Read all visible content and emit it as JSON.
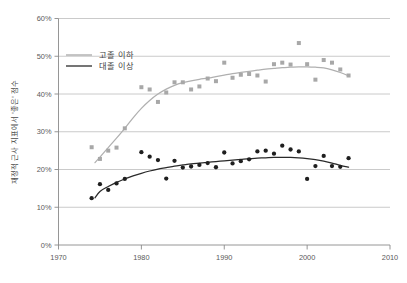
{
  "chart_data": {
    "type": "scatter",
    "title": "",
    "subtitle": "",
    "xlabel": "",
    "ylabel": "재정적 근사 지표에서 '좋은' 점수",
    "xlim": [
      1970,
      2010
    ],
    "ylim": [
      0,
      60
    ],
    "xticks": [
      1970,
      1980,
      1990,
      2000,
      2010
    ],
    "yticks": [
      0,
      10,
      20,
      30,
      40,
      50,
      60
    ],
    "xtick_labels": [
      "1970",
      "1980",
      "1990",
      "2000",
      "2010"
    ],
    "ytick_labels": [
      "0%",
      "10%",
      "20%",
      "30%",
      "40%",
      "50%",
      "60%"
    ],
    "grid": "horizontal",
    "legend_position": "upper-left-inside",
    "series": [
      {
        "name": "고졸 이하",
        "color": "#a8a8a8",
        "marker": "square",
        "x": [
          1974,
          1975,
          1976,
          1977,
          1978,
          1980,
          1981,
          1982,
          1983,
          1984,
          1985,
          1986,
          1987,
          1988,
          1989,
          1990,
          1991,
          1992,
          1993,
          1994,
          1995,
          1996,
          1997,
          1998,
          1999,
          2000,
          2001,
          2002,
          2003,
          2004,
          2005
        ],
        "values": [
          25.9,
          22.8,
          25.0,
          25.8,
          30.9,
          41.8,
          41.2,
          37.9,
          40.4,
          43.1,
          43.1,
          41.2,
          42.0,
          44.1,
          43.4,
          48.3,
          44.3,
          45.1,
          45.3,
          44.9,
          43.3,
          47.9,
          48.3,
          47.8,
          53.5,
          47.9,
          43.8,
          49.0,
          48.3,
          46.5,
          44.9
        ],
        "trend": {
          "name": "고졸 이하 추세선",
          "color": "#b0b0b0",
          "points": [
            [
              1974.4,
              21.8
            ],
            [
              1975,
              23.3
            ],
            [
              1976,
              25.8
            ],
            [
              1977,
              28.3
            ],
            [
              1978,
              30.9
            ],
            [
              1979,
              33.7
            ],
            [
              1980,
              36.2
            ],
            [
              1981,
              38.3
            ],
            [
              1982,
              40.0
            ],
            [
              1983,
              41.3
            ],
            [
              1984,
              42.3
            ],
            [
              1985,
              43.0
            ],
            [
              1986,
              43.5
            ],
            [
              1987,
              43.9
            ],
            [
              1988,
              44.2
            ],
            [
              1989,
              44.6
            ],
            [
              1990,
              45.0
            ],
            [
              1991,
              45.4
            ],
            [
              1992,
              45.7
            ],
            [
              1993,
              46.0
            ],
            [
              1994,
              46.3
            ],
            [
              1995,
              46.6
            ],
            [
              1996,
              46.8
            ],
            [
              1997,
              47.0
            ],
            [
              1998,
              47.1
            ],
            [
              1999,
              47.2
            ],
            [
              2000,
              47.2
            ],
            [
              2001,
              47.1
            ],
            [
              2002,
              46.9
            ],
            [
              2003,
              46.4
            ],
            [
              2004,
              45.7
            ],
            [
              2005,
              44.8
            ]
          ]
        }
      },
      {
        "name": "대졸 이상",
        "color": "#1f1f1f",
        "marker": "circle",
        "x": [
          1974,
          1975,
          1976,
          1977,
          1978,
          1980,
          1981,
          1982,
          1983,
          1984,
          1985,
          1986,
          1987,
          1988,
          1989,
          1990,
          1991,
          1992,
          1993,
          1994,
          1995,
          1996,
          1997,
          1998,
          1999,
          2000,
          2001,
          2002,
          2003,
          2004,
          2005
        ],
        "values": [
          12.4,
          16.1,
          14.6,
          16.3,
          17.5,
          24.6,
          23.4,
          22.5,
          17.6,
          22.3,
          20.5,
          20.8,
          21.2,
          21.7,
          20.6,
          24.5,
          21.6,
          22.2,
          22.7,
          24.8,
          25.0,
          24.2,
          26.3,
          25.3,
          24.8,
          17.5,
          20.9,
          23.6,
          20.9,
          20.7,
          23.0
        ],
        "trend": {
          "name": "대졸 이상 추세선",
          "color": "#2a2a2a",
          "points": [
            [
              1974.4,
              12.5
            ],
            [
              1975,
              14.2
            ],
            [
              1976,
              15.5
            ],
            [
              1977,
              16.6
            ],
            [
              1978,
              17.5
            ],
            [
              1979,
              18.3
            ],
            [
              1980,
              19.0
            ],
            [
              1981,
              19.6
            ],
            [
              1982,
              20.1
            ],
            [
              1983,
              20.5
            ],
            [
              1984,
              20.9
            ],
            [
              1985,
              21.2
            ],
            [
              1986,
              21.5
            ],
            [
              1987,
              21.7
            ],
            [
              1988,
              21.9
            ],
            [
              1989,
              22.1
            ],
            [
              1990,
              22.3
            ],
            [
              1991,
              22.5
            ],
            [
              1992,
              22.7
            ],
            [
              1993,
              22.9
            ],
            [
              1994,
              23.0
            ],
            [
              1995,
              23.1
            ],
            [
              1996,
              23.2
            ],
            [
              1997,
              23.2
            ],
            [
              1998,
              23.2
            ],
            [
              1999,
              23.1
            ],
            [
              2000,
              22.9
            ],
            [
              2001,
              22.6
            ],
            [
              2002,
              22.2
            ],
            [
              2003,
              21.7
            ],
            [
              2004,
              21.1
            ],
            [
              2005,
              20.6
            ]
          ]
        }
      }
    ]
  },
  "legend": {
    "items": [
      {
        "label": "고졸 이하",
        "color": "#a8a8a8"
      },
      {
        "label": "대졸 이상",
        "color": "#2a2a2a"
      }
    ]
  },
  "axes": {
    "y_title": "재정적 근사 지표에서 '좋은' 점수"
  },
  "colors": {
    "background": "#ffffff",
    "grid": "#bdbdbd",
    "axis": "#8a8a8a",
    "tick_text": "#5a5a5a",
    "series_light": "#a8a8a8",
    "series_dark": "#1f1f1f"
  }
}
